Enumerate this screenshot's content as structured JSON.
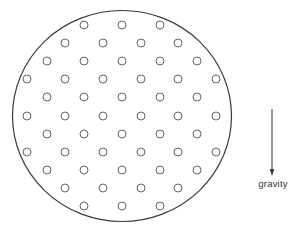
{
  "diagram": {
    "title": "",
    "container": {
      "shape": "circle",
      "cx": 122,
      "cy": 116,
      "rx": 109.5,
      "ry": 105.5,
      "stroke": "#3a3a3a",
      "stroke_width": 1.2
    },
    "particles": {
      "shape": "circle",
      "radius": 4,
      "stroke": "#555555",
      "stroke_width": 0.9,
      "fill": "none",
      "count": 52,
      "rows": [
        {
          "y": 25,
          "x": [
            84,
            122,
            160
          ]
        },
        {
          "y": 43,
          "x": [
            65,
            103,
            141,
            178
          ]
        },
        {
          "y": 61,
          "x": [
            47,
            84,
            122,
            160,
            197
          ]
        },
        {
          "y": 79,
          "x": [
            27,
            65,
            103,
            141,
            178,
            216
          ]
        },
        {
          "y": 97,
          "x": [
            47,
            84,
            122,
            160,
            197
          ]
        },
        {
          "y": 116,
          "x": [
            27,
            65,
            103,
            141,
            178,
            216
          ]
        },
        {
          "y": 134,
          "x": [
            47,
            84,
            122,
            160,
            197
          ]
        },
        {
          "y": 152,
          "x": [
            27,
            65,
            103,
            141,
            178,
            216
          ]
        },
        {
          "y": 170,
          "x": [
            47,
            84,
            122,
            160,
            197
          ]
        },
        {
          "y": 188,
          "x": [
            65,
            103,
            141,
            178
          ]
        },
        {
          "y": 206,
          "x": [
            84,
            122,
            160
          ]
        }
      ]
    },
    "gravity_arrow": {
      "x": 272,
      "y_start": 109,
      "y_end": 176,
      "direction": "down",
      "stroke": "#333333",
      "icon": "arrow-down-icon"
    },
    "gravity_label": {
      "text": "gravity",
      "x": 273,
      "y": 178
    }
  }
}
